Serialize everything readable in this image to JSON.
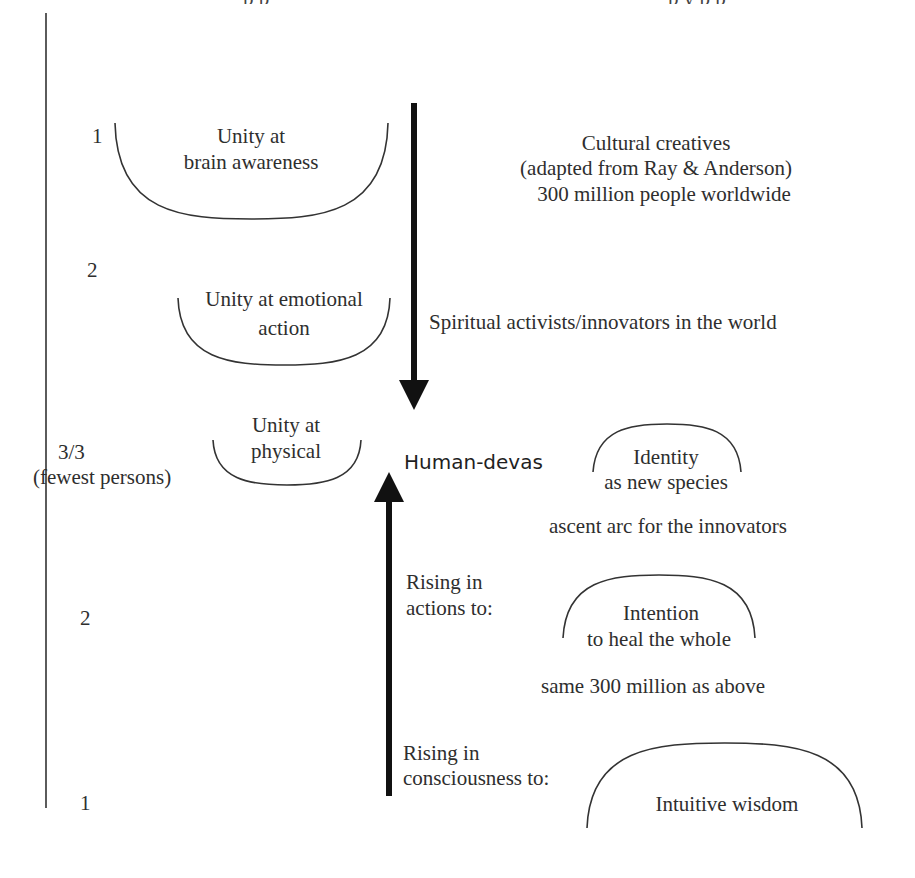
{
  "diagram": {
    "left_axis": {
      "x": 46,
      "y1": 13,
      "y2": 808,
      "color": "#333333"
    },
    "level_labels": [
      {
        "text": "1",
        "x": 92,
        "y": 124
      },
      {
        "text": "2",
        "x": 97,
        "y": 258
      },
      {
        "text": "3/3",
        "x": 87,
        "y": 452
      },
      {
        "text": "(fewest persons)",
        "x": 33,
        "y": 477
      },
      {
        "text": "2",
        "x": 88,
        "y": 608
      },
      {
        "text": "1",
        "x": 82,
        "y": 794
      }
    ],
    "descent": {
      "arrow": {
        "x": 414,
        "y_top": 103,
        "y_tip": 410,
        "color": "#111111"
      },
      "bowls": [
        {
          "line1": "Unity at",
          "line2": "brain awareness",
          "cx": 251,
          "y1": 123,
          "y2": 149,
          "arc": {
            "x1": 115,
            "x2": 388,
            "y_top": 123,
            "y_bottom": 219
          }
        },
        {
          "line1": "Unity at emotional",
          "line2": "action",
          "cx": 284,
          "y1": 289,
          "y2": 318,
          "arc": {
            "x1": 178,
            "x2": 390,
            "y_top": 298,
            "y_bottom": 365
          }
        },
        {
          "line1": "Unity at",
          "line2": "physical",
          "cx": 286,
          "y1": 415,
          "y2": 441,
          "arc": {
            "x1": 213,
            "x2": 361,
            "y_top": 440,
            "y_bottom": 485
          }
        }
      ],
      "group_label": {
        "lines": [
          "Cultural creatives",
          "(adapted from Ray & Anderson)",
          "300 million people worldwide"
        ],
        "cx": 656,
        "y": 133
      },
      "activists_label": {
        "text": "Spiritual activists/innovators in the world",
        "x": 429,
        "y": 312
      }
    },
    "center": {
      "text": "Human-devas",
      "x": 404,
      "y": 453
    },
    "ascent": {
      "arrow": {
        "x": 389,
        "y_bottom": 796,
        "y_tip": 472,
        "color": "#111111"
      },
      "domes": [
        {
          "line1": "Identity",
          "line2": "as new species",
          "cx": 666,
          "y1": 448,
          "y2": 473,
          "arc": {
            "x1": 593,
            "x2": 741,
            "y_peak": 424,
            "y_end": 472
          }
        },
        {
          "line1": "Intention",
          "line2": "to heal the whole",
          "cx": 659,
          "y1": 603,
          "y2": 628,
          "arc": {
            "x1": 563,
            "x2": 755,
            "y_peak": 575,
            "y_end": 638
          }
        },
        {
          "line1": "Intuitive wisdom",
          "line2": "",
          "cx": 727,
          "y1": 794,
          "y2": 0,
          "arc": {
            "x1": 587,
            "x2": 862,
            "y_peak": 743,
            "y_end": 828
          }
        }
      ],
      "ascent_label": {
        "text": "ascent arc for the innovators",
        "x": 516,
        "y": 517
      },
      "actions_label": {
        "line1": "Rising in",
        "line2": "actions to:",
        "x": 406,
        "y1": 572,
        "y2": 598
      },
      "same_label": {
        "text": "same 300 million as above",
        "x": 513,
        "y": 677
      },
      "consciousness_label": {
        "line1": "Rising in",
        "line2": "consciousness to:",
        "x": 403,
        "y1": 743,
        "y2": 768
      }
    },
    "top_clipped_text": "…people … … … … …"
  }
}
